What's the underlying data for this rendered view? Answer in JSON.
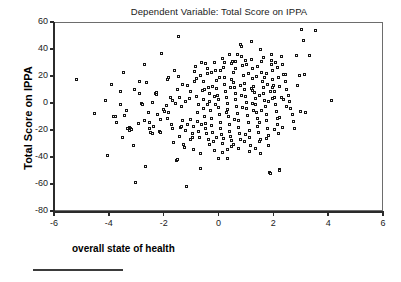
{
  "chart_data": {
    "type": "scatter",
    "title": "Dependent Variable: Total Score on IPPA",
    "xlabel": "overall state of health",
    "ylabel": "Total Score on IPPA",
    "xlim": [
      -6,
      6
    ],
    "ylim": [
      -80,
      60
    ],
    "xticks": [
      -6,
      -4,
      -2,
      0,
      2,
      4,
      6
    ],
    "xtick_labels": [
      "-6",
      "-4",
      "-2",
      "0",
      "2",
      "4",
      "6"
    ],
    "yticks": [
      60,
      40,
      20,
      0,
      -20,
      -40,
      -60,
      -80
    ],
    "ytick_labels": [
      "60",
      "40",
      "20",
      "0",
      "-20",
      "-40",
      "-60",
      "-80"
    ],
    "grid": false,
    "legend": null,
    "marker": "open-square",
    "marker_color": "#141414",
    "n_points": 330,
    "points": [
      [
        -5.2,
        18.5
      ],
      [
        -4.55,
        -7.0
      ],
      [
        -4.15,
        2.5
      ],
      [
        -4.1,
        -38.5
      ],
      [
        -3.95,
        14.5
      ],
      [
        -3.85,
        -9.0
      ],
      [
        -3.8,
        -9.5
      ],
      [
        -3.75,
        -13.5
      ],
      [
        -3.6,
        9.0
      ],
      [
        -3.55,
        -24.5
      ],
      [
        -3.5,
        23.5
      ],
      [
        -3.45,
        -8.5
      ],
      [
        -3.4,
        -4.5
      ],
      [
        -3.35,
        -18.0
      ],
      [
        -3.3,
        -17.5
      ],
      [
        -3.25,
        -18.5
      ],
      [
        -3.2,
        -19.0
      ],
      [
        -3.15,
        -30.5
      ],
      [
        -3.1,
        10.5
      ],
      [
        -3.05,
        -58.0
      ],
      [
        -2.95,
        -14.5
      ],
      [
        -2.9,
        16.5
      ],
      [
        -2.85,
        0.5
      ],
      [
        -2.8,
        0.0
      ],
      [
        -2.75,
        29.0
      ],
      [
        -2.7,
        -46.5
      ],
      [
        -2.65,
        16.0
      ],
      [
        -2.6,
        -6.5
      ],
      [
        -2.55,
        -14.0
      ],
      [
        -2.5,
        -21.0
      ],
      [
        -2.45,
        -21.5
      ],
      [
        -2.4,
        -16.5
      ],
      [
        -2.35,
        7.5
      ],
      [
        -2.3,
        7.0
      ],
      [
        -2.25,
        -7.5
      ],
      [
        -2.2,
        -20.5
      ],
      [
        -2.15,
        -21.0
      ],
      [
        -2.1,
        37.5
      ],
      [
        -2.05,
        -4.0
      ],
      [
        -2.0,
        -5.5
      ],
      [
        -1.95,
        -1.0
      ],
      [
        -1.9,
        18.5
      ],
      [
        -1.85,
        19.5
      ],
      [
        -1.8,
        4.5
      ],
      [
        -1.75,
        -15.5
      ],
      [
        -1.7,
        -18.0
      ],
      [
        -1.68,
        -28.5
      ],
      [
        -1.65,
        24.5
      ],
      [
        -1.6,
        0.5
      ],
      [
        -1.58,
        -41.5
      ],
      [
        -1.55,
        -41.0
      ],
      [
        -1.5,
        50.0
      ],
      [
        -1.48,
        20.5
      ],
      [
        -1.45,
        5.0
      ],
      [
        -1.42,
        -17.5
      ],
      [
        -1.4,
        -17.0
      ],
      [
        -1.38,
        -2.0
      ],
      [
        -1.35,
        14.5
      ],
      [
        -1.3,
        -30.0
      ],
      [
        -1.28,
        -32.0
      ],
      [
        -1.25,
        -19.5
      ],
      [
        -1.2,
        -61.0
      ],
      [
        -1.15,
        13.5
      ],
      [
        -1.1,
        4.0
      ],
      [
        -1.05,
        -11.5
      ],
      [
        -1.0,
        -22.0
      ],
      [
        -0.98,
        -25.0
      ],
      [
        -0.95,
        -33.5
      ],
      [
        -0.92,
        16.5
      ],
      [
        -0.9,
        24.0
      ],
      [
        -0.88,
        27.5
      ],
      [
        -0.85,
        5.5
      ],
      [
        -0.82,
        -6.0
      ],
      [
        -0.8,
        -13.0
      ],
      [
        -0.78,
        -20.0
      ],
      [
        -0.75,
        -20.5
      ],
      [
        -0.72,
        -24.5
      ],
      [
        -0.7,
        -47.5
      ],
      [
        -0.68,
        21.0
      ],
      [
        -0.65,
        30.5
      ],
      [
        -0.62,
        10.0
      ],
      [
        -0.6,
        3.5
      ],
      [
        -0.58,
        -3.0
      ],
      [
        -0.55,
        -9.0
      ],
      [
        -0.52,
        -14.5
      ],
      [
        -0.5,
        -18.5
      ],
      [
        -0.48,
        -21.5
      ],
      [
        -0.45,
        26.0
      ],
      [
        -0.42,
        22.5
      ],
      [
        -0.4,
        12.5
      ],
      [
        -0.38,
        7.5
      ],
      [
        -0.35,
        2.0
      ],
      [
        -0.32,
        -5.0
      ],
      [
        -0.3,
        -11.0
      ],
      [
        -0.28,
        -16.0
      ],
      [
        -0.25,
        -21.0
      ],
      [
        -0.22,
        -27.5
      ],
      [
        -0.2,
        -34.5
      ],
      [
        -0.18,
        31.0
      ],
      [
        -0.15,
        25.0
      ],
      [
        -0.12,
        17.5
      ],
      [
        -0.1,
        11.5
      ],
      [
        -0.08,
        6.5
      ],
      [
        -0.05,
        3.0
      ],
      [
        -0.02,
        -2.5
      ],
      [
        0.0,
        -8.0
      ],
      [
        0.02,
        -13.5
      ],
      [
        0.05,
        -18.0
      ],
      [
        0.08,
        -22.5
      ],
      [
        0.1,
        -29.0
      ],
      [
        0.12,
        33.5
      ],
      [
        0.15,
        27.0
      ],
      [
        0.18,
        20.0
      ],
      [
        0.2,
        14.5
      ],
      [
        0.22,
        9.5
      ],
      [
        0.25,
        4.5
      ],
      [
        0.28,
        0.5
      ],
      [
        0.3,
        -4.0
      ],
      [
        0.32,
        -9.5
      ],
      [
        0.35,
        -15.0
      ],
      [
        0.38,
        -20.0
      ],
      [
        0.4,
        -24.0
      ],
      [
        0.42,
        -27.0
      ],
      [
        0.45,
        30.0
      ],
      [
        0.48,
        31.5
      ],
      [
        0.5,
        23.0
      ],
      [
        0.52,
        16.0
      ],
      [
        0.55,
        12.0
      ],
      [
        0.58,
        8.0
      ],
      [
        0.6,
        3.5
      ],
      [
        0.62,
        -1.5
      ],
      [
        0.65,
        -7.0
      ],
      [
        0.68,
        -12.0
      ],
      [
        0.7,
        -17.5
      ],
      [
        0.72,
        -22.0
      ],
      [
        0.75,
        -26.5
      ],
      [
        0.78,
        44.0
      ],
      [
        0.8,
        42.5
      ],
      [
        0.82,
        35.0
      ],
      [
        0.85,
        28.5
      ],
      [
        0.88,
        21.0
      ],
      [
        0.9,
        15.5
      ],
      [
        0.92,
        10.5
      ],
      [
        0.95,
        5.5
      ],
      [
        0.98,
        1.0
      ],
      [
        1.0,
        -3.5
      ],
      [
        1.02,
        -8.5
      ],
      [
        1.05,
        -14.0
      ],
      [
        1.08,
        -19.5
      ],
      [
        1.1,
        -25.0
      ],
      [
        1.12,
        -31.0
      ],
      [
        1.15,
        46.0
      ],
      [
        1.18,
        33.0
      ],
      [
        1.2,
        26.5
      ],
      [
        1.22,
        19.0
      ],
      [
        1.25,
        13.0
      ],
      [
        1.28,
        8.5
      ],
      [
        1.3,
        4.0
      ],
      [
        1.32,
        -0.5
      ],
      [
        1.35,
        -6.0
      ],
      [
        1.38,
        -11.0
      ],
      [
        1.4,
        -16.5
      ],
      [
        1.42,
        -21.0
      ],
      [
        1.45,
        -28.0
      ],
      [
        1.48,
        -37.0
      ],
      [
        1.5,
        40.5
      ],
      [
        1.52,
        31.5
      ],
      [
        1.55,
        23.5
      ],
      [
        1.58,
        17.0
      ],
      [
        1.6,
        12.5
      ],
      [
        1.62,
        7.5
      ],
      [
        1.65,
        2.5
      ],
      [
        1.68,
        -2.0
      ],
      [
        1.7,
        -7.5
      ],
      [
        1.72,
        -12.5
      ],
      [
        1.75,
        -18.0
      ],
      [
        1.78,
        -23.0
      ],
      [
        1.8,
        -30.5
      ],
      [
        1.82,
        -50.5
      ],
      [
        1.85,
        -51.5
      ],
      [
        1.88,
        36.5
      ],
      [
        1.9,
        32.0
      ],
      [
        1.92,
        25.0
      ],
      [
        1.95,
        18.5
      ],
      [
        1.98,
        14.0
      ],
      [
        2.0,
        9.0
      ],
      [
        2.02,
        4.5
      ],
      [
        2.05,
        -0.5
      ],
      [
        2.08,
        -5.5
      ],
      [
        2.1,
        -10.5
      ],
      [
        2.12,
        -15.5
      ],
      [
        2.15,
        -21.5
      ],
      [
        2.18,
        -48.5
      ],
      [
        2.2,
        -49.5
      ],
      [
        2.25,
        35.0
      ],
      [
        2.3,
        29.0
      ],
      [
        2.35,
        22.0
      ],
      [
        2.4,
        16.5
      ],
      [
        2.45,
        11.0
      ],
      [
        2.5,
        6.0
      ],
      [
        2.55,
        1.5
      ],
      [
        2.6,
        -3.0
      ],
      [
        2.65,
        -8.0
      ],
      [
        2.7,
        -13.0
      ],
      [
        2.75,
        -18.5
      ],
      [
        2.8,
        36.0
      ],
      [
        2.85,
        13.5
      ],
      [
        2.9,
        21.0
      ],
      [
        2.95,
        -5.5
      ],
      [
        3.0,
        55.5
      ],
      [
        3.05,
        47.0
      ],
      [
        3.1,
        21.5
      ],
      [
        3.15,
        -6.0
      ],
      [
        3.3,
        36.0
      ],
      [
        3.5,
        54.5
      ],
      [
        4.1,
        2.5
      ],
      [
        -3.6,
        -0.5
      ],
      [
        -3.3,
        -19.5
      ],
      [
        -2.9,
        8.0
      ],
      [
        -2.55,
        -18.5
      ],
      [
        -2.3,
        8.5
      ],
      [
        -1.9,
        -10.5
      ],
      [
        -1.7,
        2.5
      ],
      [
        -1.45,
        -24.0
      ],
      [
        -1.25,
        1.5
      ],
      [
        -1.05,
        9.5
      ],
      [
        -0.95,
        -16.5
      ],
      [
        -0.85,
        19.0
      ],
      [
        -0.7,
        -36.5
      ],
      [
        -0.6,
        17.0
      ],
      [
        -0.5,
        30.0
      ],
      [
        -0.4,
        -26.0
      ],
      [
        -0.3,
        23.0
      ],
      [
        -0.2,
        5.5
      ],
      [
        -0.1,
        -24.5
      ],
      [
        0.0,
        19.5
      ],
      [
        0.1,
        -36.0
      ],
      [
        0.2,
        31.0
      ],
      [
        0.3,
        -33.5
      ],
      [
        0.4,
        12.0
      ],
      [
        0.5,
        -30.0
      ],
      [
        0.6,
        26.0
      ],
      [
        0.7,
        -33.0
      ],
      [
        0.8,
        6.0
      ],
      [
        0.9,
        -27.5
      ],
      [
        1.0,
        29.0
      ],
      [
        1.1,
        -35.0
      ],
      [
        1.2,
        0.5
      ],
      [
        1.3,
        -33.0
      ],
      [
        1.4,
        27.5
      ],
      [
        1.5,
        -26.0
      ],
      [
        1.6,
        34.5
      ],
      [
        1.7,
        -25.5
      ],
      [
        1.8,
        1.5
      ],
      [
        1.9,
        29.5
      ],
      [
        2.0,
        -19.0
      ],
      [
        2.1,
        27.0
      ],
      [
        2.2,
        13.0
      ],
      [
        2.3,
        -17.5
      ],
      [
        2.4,
        22.0
      ],
      [
        -2.15,
        -11.5
      ],
      [
        -1.85,
        -6.5
      ],
      [
        -1.35,
        -12.5
      ],
      [
        -0.75,
        0.0
      ],
      [
        -0.45,
        -0.5
      ],
      [
        -0.25,
        13.0
      ],
      [
        0.05,
        24.5
      ],
      [
        0.25,
        -6.5
      ],
      [
        0.45,
        18.0
      ],
      [
        0.65,
        37.0
      ],
      [
        0.85,
        -2.5
      ],
      [
        1.05,
        22.5
      ],
      [
        1.25,
        -4.5
      ],
      [
        1.45,
        6.5
      ],
      [
        1.65,
        20.0
      ],
      [
        1.85,
        9.5
      ],
      [
        2.05,
        30.5
      ],
      [
        2.25,
        5.0
      ],
      [
        2.45,
        -2.0
      ],
      [
        -0.55,
        11.0
      ],
      [
        -0.35,
        -30.0
      ],
      [
        0.15,
        -25.5
      ],
      [
        0.35,
        36.5
      ],
      [
        0.55,
        -11.5
      ],
      [
        0.75,
        13.5
      ],
      [
        0.95,
        -22.5
      ],
      [
        1.15,
        11.5
      ],
      [
        1.35,
        20.5
      ],
      [
        1.55,
        -4.5
      ],
      [
        1.75,
        14.5
      ],
      [
        1.95,
        4.0
      ],
      [
        2.15,
        19.5
      ],
      [
        -1.15,
        -15.0
      ],
      [
        -0.65,
        -15.5
      ],
      [
        -0.15,
        0.0
      ],
      [
        0.45,
        -31.5
      ],
      [
        0.95,
        32.0
      ],
      [
        1.45,
        -13.5
      ],
      [
        1.95,
        12.5
      ],
      [
        2.35,
        3.0
      ],
      [
        -2.75,
        -12.5
      ],
      [
        -2.45,
        1.0
      ],
      [
        -1.55,
        10.5
      ],
      [
        -1.05,
        -26.5
      ],
      [
        -0.05,
        -40.0
      ],
      [
        0.3,
        -40.5
      ],
      [
        0.6,
        31.5
      ],
      [
        1.2,
        10.0
      ],
      [
        1.7,
        22.5
      ],
      [
        2.2,
        -10.0
      ]
    ]
  },
  "footer": {
    "rule_visible": true
  }
}
